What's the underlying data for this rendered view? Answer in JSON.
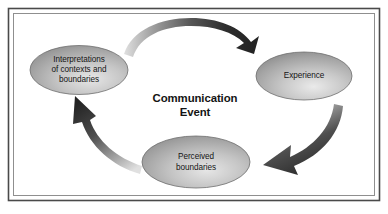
{
  "figure": {
    "name": "communication-event-cycle",
    "center_label": {
      "line1": "Communication",
      "line2": "Event"
    },
    "nodes": [
      {
        "id": "interpretations",
        "lines": [
          "Interpretations",
          "of contexts and",
          "boundaries"
        ],
        "position": "left"
      },
      {
        "id": "experience",
        "lines": [
          "Experience"
        ],
        "position": "right"
      },
      {
        "id": "perceived-boundaries",
        "lines": [
          "Perceived",
          "boundaries"
        ],
        "position": "bottom"
      }
    ],
    "arrows": [
      {
        "id": "arrow-top",
        "from": "interpretations",
        "to": "experience",
        "direction": "clockwise"
      },
      {
        "id": "arrow-right",
        "from": "experience",
        "to": "perceived-boundaries",
        "direction": "clockwise"
      },
      {
        "id": "arrow-left",
        "from": "perceived-boundaries",
        "to": "interpretations",
        "direction": "clockwise"
      }
    ],
    "colors": {
      "background": "#ffffff",
      "frame_outer": "#3c3c3c",
      "frame_inner": "#7a7a7a",
      "node_fill_light": "#e2e2e2",
      "node_fill_mid": "#b5b5b5",
      "node_fill_dark": "#8a8a8a",
      "node_stroke": "#6e6e6e",
      "arrow_dark": "#2b2b2b",
      "arrow_light": "#d8d8d8",
      "text": "#141414"
    }
  }
}
